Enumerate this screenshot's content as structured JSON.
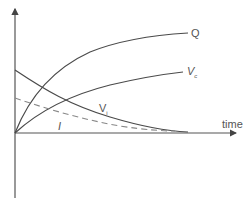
{
  "diagram": {
    "type": "capacitor charging curves",
    "axes": {
      "x_label": "time",
      "y_label": ""
    },
    "curves": [
      {
        "id": "Q",
        "label": "Q",
        "subscript": "",
        "style": "solid",
        "trend": "rising, saturating"
      },
      {
        "id": "Vc",
        "label": "V",
        "subscript": "c",
        "style": "solid",
        "trend": "rising, saturating"
      },
      {
        "id": "Vi",
        "label": "V",
        "subscript": "i",
        "style": "solid",
        "trend": "decaying"
      },
      {
        "id": "I",
        "label": "I",
        "subscript": "",
        "style": "dashed",
        "trend": "decaying"
      }
    ],
    "colors": {
      "axis": "#555555",
      "curve": "#4a4a4a",
      "dashed": "#888888",
      "text": "#555555"
    }
  }
}
